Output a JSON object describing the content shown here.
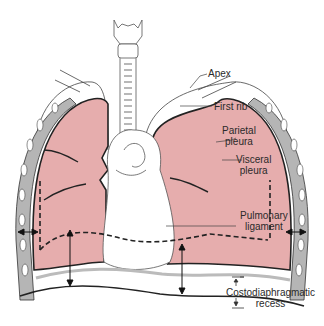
{
  "diagram": {
    "colors": {
      "lung_fill": "#e6adad",
      "outline": "#222222",
      "pleura_gray": "#9a9a9a",
      "background": "#ffffff"
    },
    "labels": {
      "apex": "Apex",
      "first_rib": "First rib",
      "parietal_pleura_1": "Parietal",
      "parietal_pleura_2": "pleura",
      "visceral_pleura_1": "Visceral",
      "visceral_pleura_2": "pleura",
      "pulmonary_ligament_1": "Pulmonary",
      "pulmonary_ligament_2": "ligament",
      "costodiaphragmatic_recess_1": "Costodiaphragmatic",
      "costodiaphragmatic_recess_2": "recess"
    }
  }
}
